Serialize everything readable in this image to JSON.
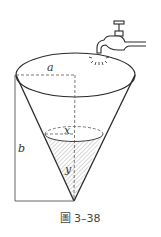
{
  "figure": {
    "caption": "圖 3–38",
    "labels": {
      "a": "a",
      "b": "b",
      "x": "x",
      "y": "y"
    }
  },
  "colors": {
    "stroke": "#2a2a2a",
    "dashed": "#555555",
    "hatch": "#9a9a9a",
    "background": "#ffffff"
  }
}
